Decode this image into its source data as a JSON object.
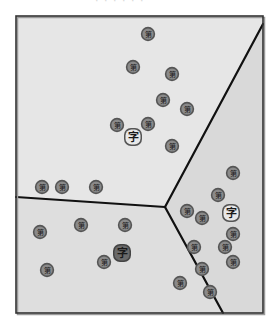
{
  "caption_fragment": "· · · · · ·",
  "frame": {
    "x": 16,
    "y": 16,
    "width": 247,
    "height": 297,
    "stroke": "#333333",
    "shadow": "#9a9a9a"
  },
  "colors": {
    "region_top": "#e6e6e6",
    "region_right": "#d9d9d9",
    "region_bottom_left": "#dedede",
    "boundary": "#111111",
    "point_outer": "#555555",
    "point_fill": "#8a8a8a",
    "point_glyph": "#1a1a1a",
    "centroid_light_fill": "#e8e8e8",
    "centroid_dark_fill": "#6a6a6a"
  },
  "boundaries": {
    "junction": [
      165,
      207
    ],
    "left_end": [
      16,
      197
    ],
    "top_right_end": [
      263,
      24
    ],
    "bottom_end": [
      223,
      313
    ]
  },
  "regions": [
    {
      "name": "region-top",
      "points": "16,16 263,16 263,24 165,207 16,197"
    },
    {
      "name": "region-right",
      "points": "263,24 263,313 223,313 165,207"
    },
    {
      "name": "region-bottom-left",
      "points": "16,197 165,207 223,313 16,313"
    }
  ],
  "point_glyph": "第",
  "centroid_glyph": "字",
  "clusters": [
    {
      "name": "cluster-top",
      "centroid": {
        "x": 133,
        "y": 137,
        "style": "light"
      },
      "points": [
        [
          148,
          34
        ],
        [
          133,
          67
        ],
        [
          172,
          74
        ],
        [
          163,
          100
        ],
        [
          187,
          109
        ],
        [
          117,
          125
        ],
        [
          148,
          124
        ],
        [
          172,
          146
        ],
        [
          42,
          187
        ],
        [
          62,
          187
        ],
        [
          96,
          187
        ]
      ]
    },
    {
      "name": "cluster-right",
      "centroid": {
        "x": 231,
        "y": 213,
        "style": "light"
      },
      "points": [
        [
          233,
          173
        ],
        [
          218,
          195
        ],
        [
          187,
          211
        ],
        [
          202,
          218
        ],
        [
          233,
          234
        ],
        [
          194,
          247
        ],
        [
          225,
          247
        ],
        [
          233,
          262
        ],
        [
          202,
          269
        ],
        [
          180,
          283
        ],
        [
          210,
          292
        ]
      ]
    },
    {
      "name": "cluster-bottom-left",
      "centroid": {
        "x": 122,
        "y": 253,
        "style": "dark"
      },
      "points": [
        [
          40,
          232
        ],
        [
          81,
          225
        ],
        [
          125,
          225
        ],
        [
          104,
          262
        ],
        [
          47,
          270
        ]
      ]
    }
  ]
}
